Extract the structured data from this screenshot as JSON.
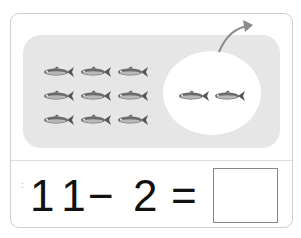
{
  "exercise": {
    "left_group_count": 9,
    "right_group_count": 2,
    "equation": {
      "operand1": "11",
      "operator": "−",
      "operand2": "2",
      "equals": "=",
      "answer": ""
    },
    "marker": ":"
  },
  "colors": {
    "panel": "#e6e6e6",
    "border": "#cfcfcf",
    "arrow": "#8a8a8a",
    "text": "#111111"
  }
}
